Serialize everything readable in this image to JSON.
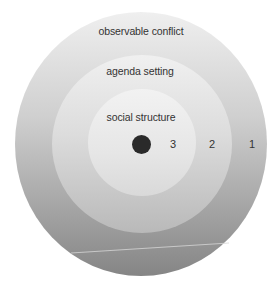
{
  "diagram": {
    "type": "concentric-circles",
    "rings": [
      {
        "level": "1",
        "label": "observable conflict",
        "position": "outer"
      },
      {
        "level": "2",
        "label": "agenda setting",
        "position": "middle"
      },
      {
        "level": "3",
        "label": "social structure",
        "position": "inner"
      }
    ],
    "numbers": [
      "3",
      "2",
      "1"
    ],
    "colors": {
      "outer_top": "#efefef",
      "outer_bottom": "#858585",
      "middle_top": "#f0f0f0",
      "middle_bottom": "#b9b9b9",
      "inner_top": "#f2f2f2",
      "inner_bottom": "#d9d9d9",
      "center_dot": "#2a2a2a",
      "text": "#333333"
    }
  }
}
